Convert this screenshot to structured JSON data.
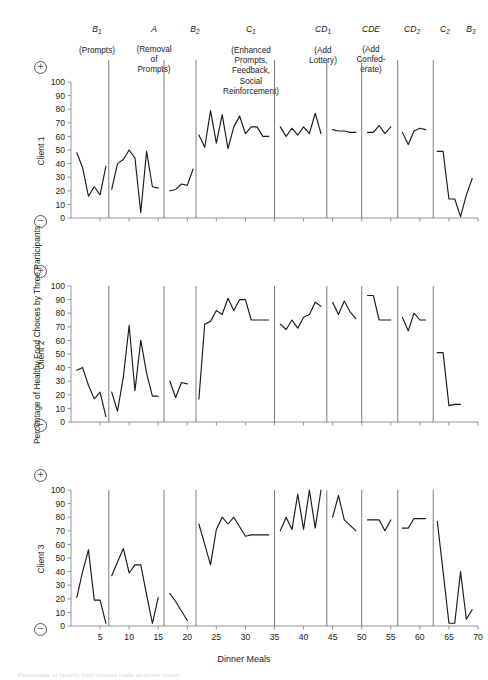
{
  "figure": {
    "xlabel": "Dinner Meals",
    "ylabel": "Percentage of Healthy Food Choices by Three Participants",
    "caption_partial": "Percentage of healthy food choices made at dinner meals",
    "positive_sign": "+",
    "negative_sign": "−"
  },
  "phases": [
    {
      "code": "B",
      "sub": "1",
      "desc": "(Prompts)"
    },
    {
      "code": "A",
      "sub": "",
      "desc": "(Removal\nof\nPrompts)"
    },
    {
      "code": "B",
      "sub": "2",
      "desc": ""
    },
    {
      "code": "C",
      "sub": "1",
      "desc": "(Enhanced\nPrompts,\nFeedback,\nSocial\nReinforcement)"
    },
    {
      "code": "CD",
      "sub": "1",
      "desc": "(Add\nLottery)"
    },
    {
      "code": "CDE",
      "sub": "",
      "desc": "(Add\nConfed-\nerate)"
    },
    {
      "code": "CD",
      "sub": "2",
      "desc": ""
    },
    {
      "code": "C",
      "sub": "2",
      "desc": ""
    },
    {
      "code": "B",
      "sub": "3",
      "desc": ""
    }
  ],
  "panels": [
    {
      "label": "Client 1"
    },
    {
      "label": "Client 2"
    },
    {
      "label": "Client 3"
    }
  ],
  "chart_data": {
    "type": "line",
    "title": "",
    "xlabel": "Dinner Meals",
    "ylabel": "Percentage of Healthy Food Choices by Three Participants",
    "xlim": [
      0,
      70
    ],
    "ylim": [
      0,
      100
    ],
    "xticks": [
      5,
      10,
      15,
      20,
      25,
      30,
      35,
      40,
      45,
      50,
      55,
      60,
      65,
      70
    ],
    "yticks": [
      0,
      10,
      20,
      30,
      40,
      50,
      60,
      70,
      80,
      90,
      100
    ],
    "grid": false,
    "legend_position": "none",
    "phase_change_x": [
      6.5,
      16.0,
      21.5,
      35.0,
      44.0,
      50.0,
      56.2,
      62.3
    ],
    "panel_labels": [
      "Client 1",
      "Client 2",
      "Client 3"
    ],
    "series": [
      {
        "name": "Client 1",
        "segments": [
          {
            "phase": "B1",
            "x": [
              1,
              2,
              3,
              4,
              5,
              6
            ],
            "y": [
              48,
              37,
              16,
              23,
              17,
              38
            ]
          },
          {
            "phase": "B1b",
            "x": [
              1,
              2,
              3,
              4,
              5,
              6
            ],
            "y": [
              48,
              37,
              16,
              23,
              17,
              38
            ],
            "note": "drawn as one continuous B1 run"
          },
          {
            "phase": "A",
            "x": [
              7,
              8,
              9,
              10,
              11,
              12,
              13,
              14,
              15
            ],
            "y": [
              21,
              40,
              43,
              50,
              44,
              4,
              49,
              23,
              22
            ]
          },
          {
            "phase": "B2",
            "x": [
              17,
              18,
              19,
              20,
              21
            ],
            "y": [
              20,
              21,
              25,
              24,
              36
            ]
          },
          {
            "phase": "C1",
            "x": [
              22,
              23,
              24,
              25,
              26,
              27,
              28,
              29,
              30,
              31,
              32,
              33,
              34
            ],
            "y": [
              61,
              52,
              79,
              55,
              76,
              51,
              67,
              75,
              62,
              67,
              67,
              60,
              60
            ]
          },
          {
            "phase": "CD1",
            "x": [
              36,
              37,
              38,
              39,
              40,
              41,
              42,
              43
            ],
            "y": [
              67,
              60,
              66,
              61,
              67,
              62,
              77,
              62
            ]
          },
          {
            "phase": "CDE",
            "x": [
              45,
              46,
              47,
              48,
              49
            ],
            "y": [
              65,
              64,
              64,
              63,
              63
            ]
          },
          {
            "phase": "CD2",
            "x": [
              51,
              52,
              53,
              54,
              55
            ],
            "y": [
              63,
              63,
              68,
              62,
              67
            ]
          },
          {
            "phase": "C2",
            "x": [
              57,
              58,
              59,
              60,
              61
            ],
            "y": [
              63,
              54,
              64,
              66,
              65
            ]
          },
          {
            "phase": "B3",
            "x": [
              63,
              64,
              65,
              66,
              67,
              68,
              69
            ],
            "y": [
              49,
              49,
              14,
              14,
              1,
              17,
              29
            ]
          }
        ]
      },
      {
        "name": "Client 2",
        "segments": [
          {
            "phase": "B1",
            "x": [
              1,
              2,
              3,
              4,
              5,
              6
            ],
            "y": [
              38,
              40,
              27,
              17,
              22,
              4
            ]
          },
          {
            "phase": "A",
            "x": [
              7,
              8,
              9,
              10,
              11,
              12,
              13,
              14,
              15
            ],
            "y": [
              22,
              8,
              33,
              71,
              23,
              60,
              36,
              19,
              19
            ]
          },
          {
            "phase": "B2",
            "x": [
              17,
              18,
              19,
              20
            ],
            "y": [
              30,
              18,
              29,
              28
            ]
          },
          {
            "phase": "C1",
            "x": [
              22,
              23,
              24,
              25,
              26,
              27,
              28,
              29,
              30,
              31,
              32,
              33,
              34
            ],
            "y": [
              17,
              72,
              74,
              82,
              79,
              91,
              82,
              90,
              90,
              75,
              75,
              75,
              75
            ]
          },
          {
            "phase": "CD1",
            "x": [
              36,
              37,
              38,
              39,
              40,
              41,
              42,
              43
            ],
            "y": [
              72,
              68,
              75,
              69,
              77,
              79,
              88,
              85
            ]
          },
          {
            "phase": "CDE",
            "x": [
              45,
              46,
              47,
              48,
              49
            ],
            "y": [
              88,
              79,
              89,
              81,
              76
            ]
          },
          {
            "phase": "CD2",
            "x": [
              51,
              52,
              53,
              54,
              55
            ],
            "y": [
              93,
              93,
              75,
              75,
              75
            ]
          },
          {
            "phase": "C2",
            "x": [
              57,
              58,
              59,
              60,
              61
            ],
            "y": [
              77,
              67,
              80,
              75,
              75
            ]
          },
          {
            "phase": "B3",
            "x": [
              63,
              64,
              65,
              66,
              67
            ],
            "y": [
              51,
              51,
              12,
              13,
              13
            ]
          }
        ]
      },
      {
        "name": "Client 3",
        "segments": [
          {
            "phase": "B1",
            "x": [
              1,
              2,
              3,
              4,
              5,
              6
            ],
            "y": [
              21,
              40,
              56,
              19,
              19,
              2
            ]
          },
          {
            "phase": "A",
            "x": [
              7,
              8,
              9,
              10,
              11,
              12,
              13,
              14,
              15
            ],
            "y": [
              37,
              47,
              57,
              39,
              45,
              45,
              23,
              2,
              21
            ]
          },
          {
            "phase": "B2",
            "x": [
              17,
              18,
              19,
              20
            ],
            "y": [
              24,
              18,
              11,
              4
            ]
          },
          {
            "phase": "C1",
            "x": [
              22,
              23,
              24,
              25,
              26,
              27,
              28,
              29,
              30,
              31,
              32,
              33,
              34
            ],
            "y": [
              75,
              60,
              45,
              71,
              80,
              75,
              80,
              73,
              66,
              67,
              67,
              67,
              67
            ]
          },
          {
            "phase": "CD1",
            "x": [
              36,
              37,
              38,
              39,
              40,
              41,
              42,
              43
            ],
            "y": [
              70,
              80,
              71,
              97,
              71,
              100,
              72,
              100
            ]
          },
          {
            "phase": "CDE",
            "x": [
              45,
              46,
              47,
              48,
              49
            ],
            "y": [
              80,
              96,
              78,
              74,
              70
            ]
          },
          {
            "phase": "CD2",
            "x": [
              51,
              52,
              53,
              54,
              55
            ],
            "y": [
              78,
              78,
              78,
              70,
              78
            ]
          },
          {
            "phase": "C2",
            "x": [
              57,
              58,
              59,
              60,
              61
            ],
            "y": [
              72,
              72,
              79,
              79,
              79
            ]
          },
          {
            "phase": "B3",
            "x": [
              63,
              64,
              65,
              66,
              67,
              68,
              69
            ],
            "y": [
              77,
              40,
              2,
              2,
              40,
              5,
              12
            ]
          }
        ]
      }
    ]
  }
}
